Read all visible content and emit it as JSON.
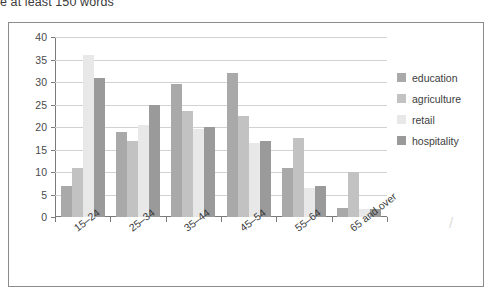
{
  "caption": "e at least 150 words",
  "figure": {
    "frame_color": "#8c8c8c",
    "background": "#ffffff"
  },
  "legend": {
    "position": "right",
    "items": [
      {
        "label": "education",
        "color": "#a9a9a9"
      },
      {
        "label": "agriculture",
        "color": "#c2c2c2"
      },
      {
        "label": "retail",
        "color": "#e8e8e8"
      },
      {
        "label": "hospitality",
        "color": "#9a9a9a"
      }
    ]
  },
  "axes": {
    "y_ticks": [
      "0",
      "5",
      "10",
      "15",
      "20",
      "25",
      "30",
      "35",
      "40"
    ],
    "x_ticks": [
      "15–24",
      "25–34",
      "35–44",
      "45–54",
      "55–64",
      "65 and over"
    ]
  },
  "chart_data": {
    "type": "bar",
    "title": "",
    "subtitle": "",
    "xlabel": "",
    "ylabel": "",
    "ylim": [
      0,
      40
    ],
    "ytick_step": 5,
    "grid": true,
    "legend_position": "right",
    "categories": [
      "15–24",
      "25–34",
      "35–44",
      "45–54",
      "55–64",
      "65 and over"
    ],
    "series": [
      {
        "name": "education",
        "color": "#a9a9a9",
        "values": [
          7,
          19,
          29.5,
          32,
          11,
          2
        ]
      },
      {
        "name": "agriculture",
        "color": "#c2c2c2",
        "values": [
          11,
          17,
          23.5,
          22.5,
          17.5,
          10
        ]
      },
      {
        "name": "retail",
        "color": "#e8e8e8",
        "values": [
          36,
          20.5,
          19.5,
          16.5,
          6.5,
          1.7
        ]
      },
      {
        "name": "hospitality",
        "color": "#9a9a9a",
        "values": [
          31,
          25,
          20,
          17,
          7,
          1.7
        ]
      }
    ]
  },
  "stray_mark": "/"
}
